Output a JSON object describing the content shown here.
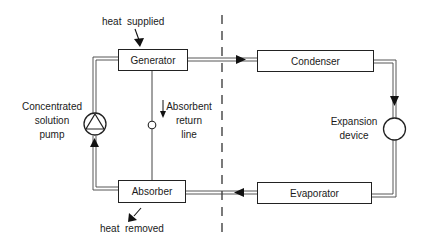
{
  "diagram": {
    "components": {
      "generator": "Generator",
      "condenser": "Condenser",
      "absorber": "Absorber",
      "evaporator": "Evaporator"
    },
    "labels": {
      "heat_supplied": "heat  supplied",
      "heat_removed": "heat  removed",
      "pump_line1": "Concentrated",
      "pump_line2": "solution",
      "pump_line3": "pump",
      "return_line1": "Absorbent",
      "return_line2": "return",
      "return_line3": "line",
      "expansion_line1": "Expansion",
      "expansion_line2": "device"
    },
    "colors": {
      "line": "#222222",
      "background": "#ffffff"
    }
  }
}
